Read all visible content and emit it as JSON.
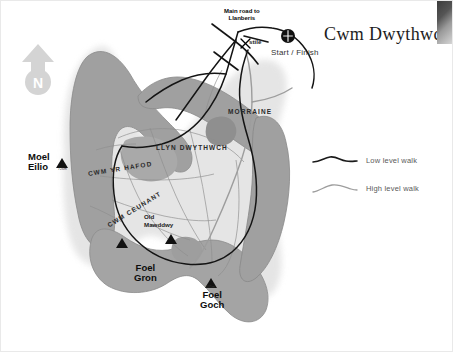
{
  "slide": {
    "title": "Cwm Dwythwch",
    "background_color": "#ffffff",
    "border_color": "#e9e9e9"
  },
  "map": {
    "north_arrow": {
      "label": "N",
      "icon": "north-arrow-icon",
      "color": "#d2d2d2"
    },
    "annotations": {
      "main_road_line1": "Main road to",
      "main_road_line2": "Llanberis",
      "stile": "stile",
      "start_finish": "Start / Finish",
      "start_finish_icon": "start-finish-marker-icon"
    },
    "features": [
      {
        "name": "Moel Eilio",
        "type": "peak",
        "label_line1": "Moel",
        "label_line2": "Eilio",
        "elevation": "726m"
      },
      {
        "name": "Foel Gron",
        "type": "peak",
        "label_line1": "Foel",
        "label_line2": "Gron",
        "elevation": "629m"
      },
      {
        "name": "Foel Goch",
        "type": "peak",
        "label_line1": "Foel",
        "label_line2": "Goch",
        "elevation": "605m"
      },
      {
        "name": "Llyn Dwythwch",
        "type": "lake",
        "label": "LLYN DWYTHWCH"
      },
      {
        "name": "Morraine",
        "type": "landform",
        "label": "MORRAINE"
      },
      {
        "name": "Cwm yr Hafod",
        "type": "valley",
        "label": "CWM YR HAFOD"
      },
      {
        "name": "Cwm Ceunant",
        "type": "valley",
        "label": "CWM CEUNANT"
      },
      {
        "name": "Old Mawddwy",
        "type": "ruin",
        "label_line1": "Old",
        "label_line2": "Mawddwy"
      }
    ],
    "colors": {
      "terrain_dark": "#9a9a9a",
      "terrain_mid": "#b5b5b5",
      "terrain_halo": "#e3e3e3",
      "lake": "#a9a9a9",
      "low_level_path": "#1a1a1a",
      "high_level_path": "#9d9d9d"
    }
  },
  "legend": {
    "items": [
      {
        "label": "Low level walk",
        "style": "low-level-walk-swatch",
        "color": "#1a1a1a"
      },
      {
        "label": "High level walk",
        "style": "high-level-walk-swatch",
        "color": "#9d9d9d"
      }
    ]
  }
}
